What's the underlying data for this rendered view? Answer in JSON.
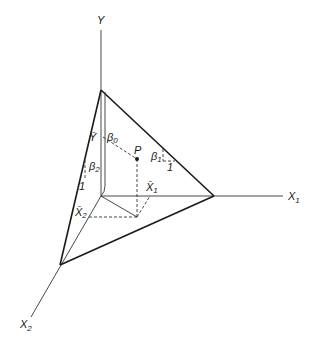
{
  "diagram": {
    "type": "3d regression plane",
    "axes": {
      "y": {
        "label": "Y"
      },
      "x1": {
        "label": "X",
        "subscript": "1"
      },
      "x2": {
        "label": "X",
        "subscript": "2"
      }
    },
    "point": {
      "label": "P"
    },
    "labels": {
      "y_bar": "Ȳ",
      "beta0": "β",
      "beta0_sub": "0",
      "beta1": "β",
      "beta1_sub": "1",
      "beta2": "β",
      "beta2_sub": "2",
      "x1_bar": "X̄",
      "x1_bar_sub": "1",
      "x2_bar": "X̄",
      "x2_bar_sub": "2",
      "unit1": "1",
      "unit2": "1"
    },
    "colors": {
      "line": "#1a1a1a",
      "background": "#ffffff"
    }
  }
}
